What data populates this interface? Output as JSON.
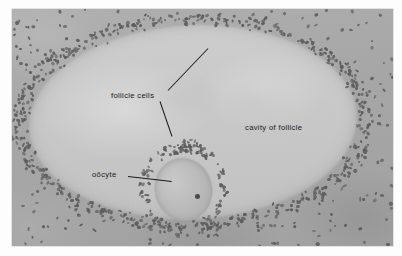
{
  "figure": {
    "kind": "histology-micrograph",
    "rendering": "grayscale",
    "page_background": "#ffffff",
    "plate": {
      "left": 12,
      "top": 9,
      "width": 381,
      "height": 237,
      "stroma_color": "#a9a9a9",
      "antrum_color": "#c8c8c8",
      "nucleus_color": "#5d5d5d",
      "oocyte_color": "#bfbfbf",
      "nucleolus_color": "#4a4a4a",
      "leader_line_color": "#1c1c1c",
      "label_text_color": "#1a1a1a"
    }
  },
  "labels": [
    {
      "id": "follicle-cells",
      "text": "follicle cells",
      "x": 111,
      "y": 92,
      "leaders": [
        {
          "x1": 168,
          "y1": 90,
          "x2": 208,
          "y2": 48
        },
        {
          "x1": 160,
          "y1": 101,
          "x2": 172,
          "y2": 136
        }
      ]
    },
    {
      "id": "cavity-of-follicle",
      "text": "cavity of follicle",
      "x": 245,
      "y": 124,
      "leaders": []
    },
    {
      "id": "oocyte",
      "text": "oōcyte",
      "x": 92,
      "y": 171,
      "leaders": [
        {
          "x1": 128,
          "y1": 176,
          "x2": 172,
          "y2": 181
        }
      ]
    }
  ],
  "structures": [
    {
      "name": "cavity of follicle",
      "note": "large pale antrum occupying centre of plate"
    },
    {
      "name": "follicle cells",
      "note": "dense granulosa nuclei ringing the antrum and the corona around the oocyte"
    },
    {
      "name": "oōcyte",
      "note": "oval egg cell with single dark nucleolus, lower-left of antrum"
    },
    {
      "name": "stroma",
      "note": "scattered nuclei in surrounding ovarian tissue"
    }
  ],
  "nuclei_field": {
    "description": "scattered dark elliptical nuclei rendered procedurally",
    "stroma_count": 470,
    "granulosa_band_count": 560,
    "corona_count": 120,
    "dot_width_px": [
      2.2,
      4.6
    ],
    "dot_height_px": [
      1.8,
      3.6
    ]
  }
}
